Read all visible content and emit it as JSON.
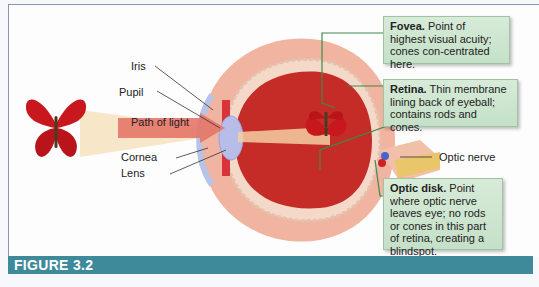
{
  "labels": {
    "iris": "Iris",
    "pupil": "Pupil",
    "path_of_light": "Path of light",
    "cornea": "Cornea",
    "lens": "Lens",
    "optic_nerve": "Optic nerve"
  },
  "callouts": {
    "fovea": {
      "title": "Fovea.",
      "text": "Point of highest visual acuity; cones con-centrated here."
    },
    "retina": {
      "title": "Retina.",
      "text": "Thin membrane lining back of eyeball; contains rods and cones."
    },
    "optic_disk": {
      "title": "Optic disk.",
      "text": "Point where optic nerve leaves eye; no rods or cones in this part of retina, creating a blindspot."
    }
  },
  "figure": {
    "label": "FIGURE 3.2"
  },
  "colors": {
    "figure_bar": "#3f8a9a",
    "callout_bg": "#cfe6d1",
    "leader_green": "#3d8a4a",
    "eye_red": "#c0282a",
    "sclera": "#f1b9a6"
  }
}
